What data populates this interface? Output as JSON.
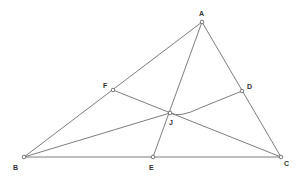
{
  "diagram": {
    "type": "triangle-cevians",
    "stroke_color": "#6e6e6e",
    "points": {
      "A": {
        "label": "A",
        "x": 202,
        "y": 22,
        "lx": 201,
        "ly": 16
      },
      "B": {
        "label": "B",
        "x": 24,
        "y": 157,
        "lx": 13,
        "ly": 170
      },
      "C": {
        "label": "C",
        "x": 281,
        "y": 157,
        "lx": 285,
        "ly": 166
      },
      "D": {
        "label": "D",
        "x": 242,
        "y": 91,
        "lx": 248,
        "ly": 89
      },
      "E": {
        "label": "E",
        "x": 153,
        "y": 157,
        "lx": 149,
        "ly": 170
      },
      "F": {
        "label": "F",
        "x": 113,
        "y": 90,
        "lx": 103,
        "ly": 88
      },
      "J": {
        "label": "J",
        "x": 170,
        "y": 113,
        "lx": 170,
        "ly": 125
      }
    },
    "segments": [
      [
        "A",
        "B"
      ],
      [
        "A",
        "C"
      ],
      [
        "B",
        "C"
      ],
      [
        "A",
        "E"
      ],
      [
        "F",
        "C"
      ],
      [
        "B",
        "J"
      ]
    ],
    "curves": [
      {
        "from": "J",
        "to": "D",
        "path": "M170,113 Q180,118 200,108 L242,91"
      }
    ]
  }
}
